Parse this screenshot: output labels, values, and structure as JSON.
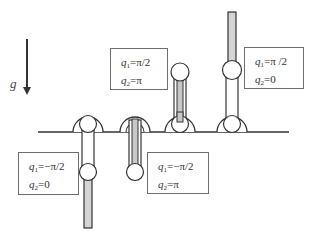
{
  "diagram": {
    "gravity_label": "g",
    "colors": {
      "line": "#333333",
      "link_fill_gray": "#d4d4d4",
      "box_border": "#6e6e6e",
      "background": "#ffffff"
    },
    "configurations": [
      {
        "id": "config-1",
        "q1_var": "q",
        "q1_sub": "1",
        "q1_value": "=−π/2",
        "q2_var": "q",
        "q2_sub": "2",
        "q2_value": "=0",
        "description": "link 1 down, link 2 down (hanging)"
      },
      {
        "id": "config-2",
        "q1_var": "q",
        "q1_sub": "1",
        "q1_value": "=−π/2",
        "q2_var": "q",
        "q2_sub": "2",
        "q2_value": "=π",
        "description": "link 1 down, link 2 folded back up"
      },
      {
        "id": "config-3",
        "q1_var": "q",
        "q1_sub": "1",
        "q1_value": "=π/2",
        "q2_var": "q",
        "q2_sub": "2",
        "q2_value": "=π",
        "description": "link 1 up, link 2 folded back down"
      },
      {
        "id": "config-4",
        "q1_var": "q",
        "q1_sub": "1",
        "q1_value": "=π /2",
        "q2_var": "q",
        "q2_sub": "2",
        "q2_value": "=0",
        "description": "link 1 up, link 2 up (inverted)"
      }
    ]
  }
}
